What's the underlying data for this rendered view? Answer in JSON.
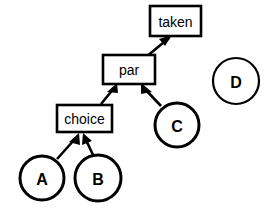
{
  "diagram": {
    "background_color": "#ffffff",
    "stroke_color": "#000000",
    "fill_color": "#ffffff",
    "box_nodes": [
      {
        "id": "taken",
        "label": "taken",
        "x": 150,
        "y": 6,
        "width": 51,
        "height": 30,
        "stroke_width": 2.6,
        "font_size": 14
      },
      {
        "id": "par",
        "label": "par",
        "x": 103,
        "y": 55,
        "width": 52,
        "height": 29,
        "stroke_width": 2.6,
        "font_size": 14
      },
      {
        "id": "choice",
        "label": "choice",
        "x": 57,
        "y": 105,
        "width": 55,
        "height": 27,
        "stroke_width": 2.6,
        "font_size": 14
      }
    ],
    "circle_nodes": [
      {
        "id": "A",
        "label": "A",
        "cx": 42,
        "cy": 178,
        "r": 22,
        "stroke_width": 3.0,
        "font_size": 16
      },
      {
        "id": "B",
        "label": "B",
        "cx": 98,
        "cy": 178,
        "r": 23,
        "stroke_width": 3.0,
        "font_size": 16
      },
      {
        "id": "C",
        "label": "C",
        "cx": 177,
        "cy": 125,
        "r": 22,
        "stroke_width": 3.0,
        "font_size": 16
      },
      {
        "id": "D",
        "label": "D",
        "cx": 236,
        "cy": 81,
        "r": 23,
        "stroke_width": 2.2,
        "font_size": 16
      }
    ],
    "edges": [
      {
        "id": "par-to-taken",
        "from": "par",
        "to": "taken",
        "x1": 146,
        "y1": 57,
        "x2": 169,
        "y2": 38,
        "stroke_width": 2.6
      },
      {
        "id": "choice-to-par",
        "from": "choice",
        "to": "par",
        "x1": 101,
        "y1": 104,
        "x2": 115,
        "y2": 86,
        "stroke_width": 2.6
      },
      {
        "id": "C-to-par",
        "from": "C",
        "to": "par",
        "x1": 161,
        "y1": 106,
        "x2": 143,
        "y2": 86,
        "stroke_width": 2.6
      },
      {
        "id": "A-to-choice",
        "from": "A",
        "to": "choice",
        "x1": 57,
        "y1": 159,
        "x2": 78,
        "y2": 134,
        "stroke_width": 2.6
      },
      {
        "id": "B-to-choice",
        "from": "B",
        "to": "choice",
        "x1": 93,
        "y1": 157,
        "x2": 84,
        "y2": 134,
        "stroke_width": 2.6
      }
    ],
    "isolated_nodes": [
      "D"
    ]
  }
}
